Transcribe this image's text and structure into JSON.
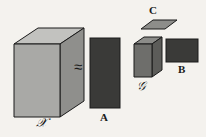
{
  "figure": {
    "type": "tucker-decomposition-diagram",
    "background_color": "#f4f2ee",
    "stroke_color": "#1a1a1a",
    "approx_symbol": "≈"
  },
  "labels": {
    "tensor_x": "𝒳",
    "matrix_a": "A",
    "matrix_b": "B",
    "matrix_c": "C",
    "core_g": "𝒢"
  },
  "shapes": {
    "tensor_x": {
      "name": "data-tensor-cuboid",
      "front_face_color": "#a9a9a6",
      "top_face_color": "#c2c2bf",
      "side_face_color": "#8f8f8c",
      "front": "14,44 60,44 60,117 14,117",
      "top": "14,44 38,28 84,28 60,44",
      "side": "60,44 84,28 84,101 60,117"
    },
    "matrix_a": {
      "name": "factor-matrix-a",
      "fill_color": "#3a3a38",
      "rect": "90,38 30,70"
    },
    "matrix_c": {
      "name": "factor-matrix-c",
      "fill_color": "#8d8d8a",
      "parallelogram": "141,29 153,20 177,20 165,29"
    },
    "core_g": {
      "name": "core-tensor-cuboid",
      "front_face_color": "#6e6e6b",
      "top_face_color": "#8c8c89",
      "side_face_color": "#5c5c59",
      "front": "134,44 152,44 152,77 134,77",
      "top": "134,44 144,37 162,37 152,44",
      "side": "152,44 162,37 162,70 152,77"
    },
    "matrix_b": {
      "name": "factor-matrix-b",
      "fill_color": "#3a3a38",
      "rect": "166,39 32,23"
    }
  }
}
